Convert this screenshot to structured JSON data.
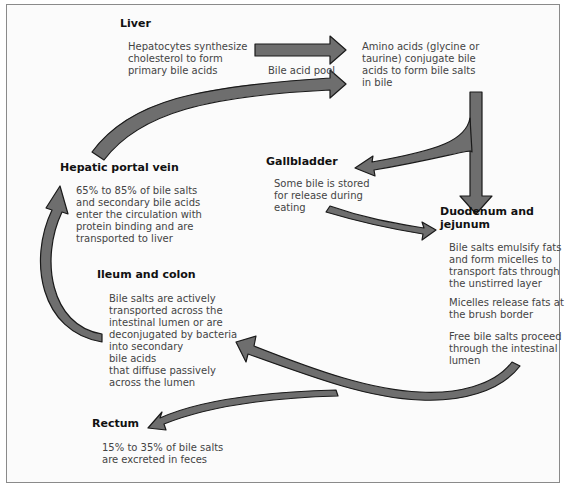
{
  "diagram": {
    "type": "flow-cycle",
    "arrow_fill": "#6e6e6e",
    "arrow_stroke": "#1a1a1a",
    "nodes": {
      "liver": {
        "heading": "Liver",
        "text": "Hepatocytes synthesize\ncholesterol to form\nprimary bile acids"
      },
      "conjugation": {
        "text": "Amino acids (glycine or\ntaurine) conjugate bile\nacids to form bile salts\nin bile"
      },
      "gallbladder": {
        "heading": "Gallbladder",
        "text": "Some bile is stored\nfor release during\neating"
      },
      "duodenum": {
        "heading": "Duodenum and\njejunum",
        "text1": "Bile salts emulsify fats\nand form micelles to\ntransport fats through\nthe unstirred layer",
        "text2": "Micelles release fats at\nthe brush border",
        "text3": "Free bile salts proceed\nthrough the intestinal\nlumen"
      },
      "hepatic_portal_vein": {
        "heading": "Hepatic portal vein",
        "text": "65% to 85% of bile salts\nand secondary bile acids\nenter the circulation with\nprotein binding and are\ntransported to liver"
      },
      "ileum_colon": {
        "heading": "Ileum and colon",
        "text": "Bile salts are actively\ntransported across the\nintestinal lumen or are\ndeconjugated by bacteria\ninto secondary\nbile acids\nthat diffuse passively\nacross the lumen"
      },
      "rectum": {
        "heading": "Rectum",
        "text": "15% to 35% of bile salts\nare excreted in feces"
      }
    },
    "edge_labels": {
      "bile_acid_pool": "Bile acid pool"
    },
    "edges": [
      {
        "from": "liver",
        "to": "conjugation"
      },
      {
        "from": "hepatic_portal_vein",
        "to": "conjugation",
        "label": "Bile acid pool"
      },
      {
        "from": "conjugation",
        "to": "duodenum"
      },
      {
        "from": "conjugation",
        "to": "gallbladder"
      },
      {
        "from": "gallbladder",
        "to": "duodenum"
      },
      {
        "from": "duodenum",
        "to": "ileum_colon"
      },
      {
        "from": "duodenum",
        "to": "rectum"
      },
      {
        "from": "ileum_colon",
        "to": "hepatic_portal_vein"
      }
    ]
  }
}
